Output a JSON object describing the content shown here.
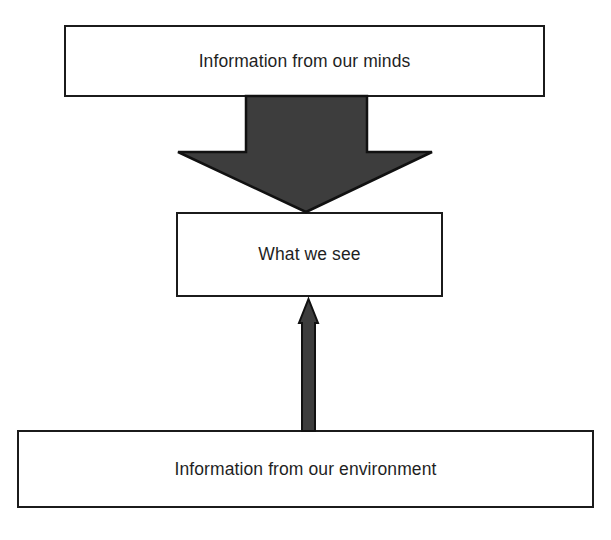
{
  "diagram": {
    "type": "flow-diagram",
    "background_color": "#ffffff",
    "nodes": [
      {
        "id": "minds",
        "label": "Information from our minds",
        "shape": "rectangle",
        "fill_color": "#ffffff",
        "border_color": "#1b1b1b",
        "text_color": "#1f1f1f"
      },
      {
        "id": "see",
        "label": "What we see",
        "shape": "rectangle",
        "fill_color": "#ffffff",
        "border_color": "#1b1b1b",
        "text_color": "#1f1f1f"
      },
      {
        "id": "environment",
        "label": "Information from our environment",
        "shape": "rectangle",
        "fill_color": "#ffffff",
        "border_color": "#1b1b1b",
        "text_color": "#1f1f1f"
      }
    ],
    "edges": [
      {
        "id": "minds-to-see",
        "from": "minds",
        "to": "see",
        "direction": "down",
        "style": "wide-block-arrow",
        "fill_color": "#3d3d3d",
        "border_color": "#111111"
      },
      {
        "id": "environment-to-see",
        "from": "environment",
        "to": "see",
        "direction": "up",
        "style": "thin-block-arrow",
        "fill_color": "#3d3d3d",
        "border_color": "#111111"
      }
    ]
  }
}
